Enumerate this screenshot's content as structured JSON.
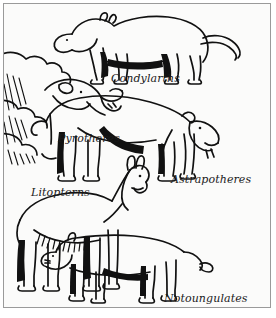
{
  "figure": {
    "kind": "line-art-illustration",
    "style": "black-and-white pen-and-ink line drawing",
    "background_color": "#fbfbfa",
    "ink_color": "#111111",
    "frame_color": "#9a9a9a",
    "labels": [
      {
        "id": "condylarths",
        "text": "Condylarths",
        "animal": "dog-like quadruped facing left, long tapering tail, black shading on belly and legs"
      },
      {
        "id": "pyrotheres",
        "text": "Pyrotheres",
        "animal": "heavy-headed beast facing right with open mouth and short trunk, body clipped by left frame edge, hatched shading"
      },
      {
        "id": "astrapotheres",
        "text": "Astrapotheres",
        "animal": "humped-back browser facing right with downward tusks and short curled tail"
      },
      {
        "id": "litopterns",
        "text": "Litopterns",
        "animal": "llama-like animal facing right with long neck, upright ears and shaggy black leg shading"
      },
      {
        "id": "notoungulates",
        "text": "Notoungulates",
        "animal": "rodent-like quadruped facing left with blunt snout and tufted tail"
      }
    ]
  }
}
